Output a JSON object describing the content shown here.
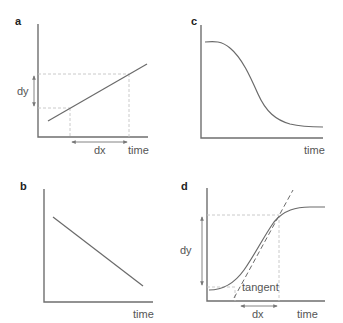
{
  "figure": {
    "panels": [
      {
        "id": "a",
        "label": "a",
        "x_axis_label": "time",
        "annotations": {
          "dy": "dy",
          "dx": "dx"
        },
        "description": "linear increase with dx/dy slope markers"
      },
      {
        "id": "b",
        "label": "b",
        "x_axis_label": "time",
        "description": "linear decrease"
      },
      {
        "id": "c",
        "label": "c",
        "x_axis_label": "time",
        "description": "sigmoidal decrease"
      },
      {
        "id": "d",
        "label": "d",
        "x_axis_label": "time",
        "annotations": {
          "dy": "dy",
          "dx": "dx",
          "tangent": "tangent"
        },
        "description": "sigmoidal increase with tangent line at inflection"
      }
    ]
  },
  "colors": {
    "axis": "#6f6f6f",
    "curve": "#6a6a6a",
    "dashed_guides": "#c4c4c4",
    "text": "#555555"
  }
}
